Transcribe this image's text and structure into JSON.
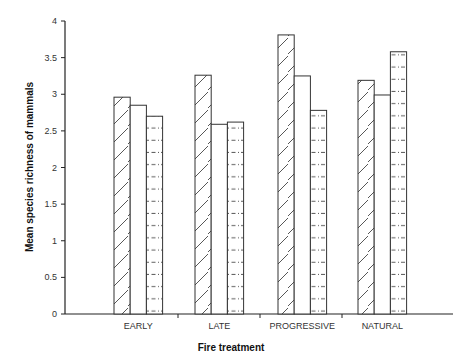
{
  "chart_data": {
    "type": "bar",
    "title": "",
    "xlabel": "Fire treatment",
    "ylabel": "Mean species richness of mammals",
    "categories": [
      "EARLY",
      "LATE",
      "PROGRESSIVE",
      "NATURAL"
    ],
    "series": [
      {
        "name": "Series 1 (diagonal hatch)",
        "pattern": "diagonal",
        "values": [
          2.96,
          3.26,
          3.81,
          3.19
        ]
      },
      {
        "name": "Series 2 (open)",
        "pattern": "none",
        "values": [
          2.85,
          2.59,
          3.25,
          2.99
        ]
      },
      {
        "name": "Series 3 (dashed horizontal)",
        "pattern": "dashed",
        "values": [
          2.7,
          2.62,
          2.78,
          3.58
        ]
      }
    ],
    "ylim": [
      0,
      4
    ],
    "yticks": [
      "0",
      "0.5",
      "1",
      "1.5",
      "2",
      "2.5",
      "3",
      "3.5",
      "4"
    ],
    "grid": false,
    "legend": null
  }
}
